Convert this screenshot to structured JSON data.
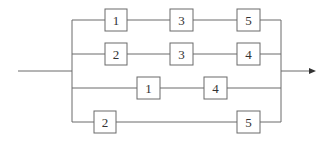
{
  "diagram": {
    "type": "reliability-block-diagram",
    "line_color": "#555555",
    "paths": [
      {
        "row": 1,
        "blocks": [
          "1",
          "3",
          "5"
        ]
      },
      {
        "row": 2,
        "blocks": [
          "2",
          "3",
          "4"
        ]
      },
      {
        "row": 3,
        "blocks": [
          "1",
          "4"
        ]
      },
      {
        "row": 4,
        "blocks": [
          "2",
          "5"
        ]
      }
    ],
    "labels": {
      "r1b1": "1",
      "r1b2": "3",
      "r1b3": "5",
      "r2b1": "2",
      "r2b2": "3",
      "r2b3": "4",
      "r3b1": "1",
      "r3b2": "4",
      "r4b1": "2",
      "r4b2": "5"
    }
  }
}
